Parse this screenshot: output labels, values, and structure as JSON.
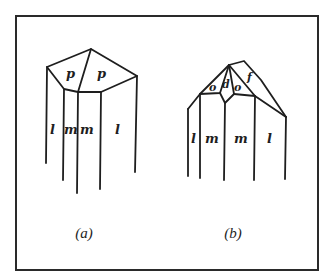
{
  "figure": {
    "panels": [
      {
        "id": "a",
        "caption": "(a)",
        "faces": {
          "p_left": "p",
          "p_right": "p",
          "l_left": "l",
          "m_left": "m",
          "m_right": "m",
          "l_right": "l"
        }
      },
      {
        "id": "b",
        "caption": "(b)",
        "faces": {
          "o_left": "o",
          "d": "d",
          "o_right": "o",
          "f": "f",
          "l_left": "l",
          "m_left": "m",
          "m_right": "m",
          "l_right": "l"
        }
      }
    ]
  }
}
